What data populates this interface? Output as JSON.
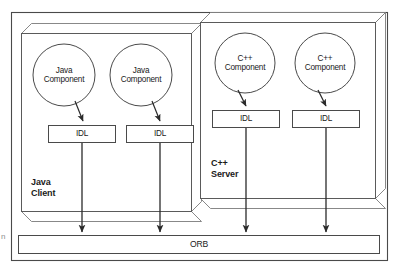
{
  "figure": {
    "margin_glyph": "n"
  },
  "zones": [
    {
      "id": "java-client",
      "label_line1": "Java",
      "label_line2": "Client",
      "x": 21,
      "y": 33,
      "w": 170,
      "h": 178,
      "depth": 10
    },
    {
      "id": "cpp-server",
      "label_line1": "C++",
      "label_line2": "Server",
      "x": 200,
      "y": 22,
      "w": 175,
      "h": 176,
      "depth": 10
    }
  ],
  "components": [
    {
      "id": "java-component-1",
      "line1": "Java",
      "line2": "Component",
      "cx": 64,
      "cy": 75,
      "r": 31
    },
    {
      "id": "java-component-2",
      "line1": "Java",
      "line2": "Component",
      "cx": 141,
      "cy": 75,
      "r": 31
    },
    {
      "id": "cpp-component-1",
      "line1": "C++",
      "line2": "Component",
      "cx": 245,
      "cy": 63,
      "r": 30
    },
    {
      "id": "cpp-component-2",
      "line1": "C++",
      "line2": "Component",
      "cx": 325,
      "cy": 63,
      "r": 30
    }
  ],
  "idl_boxes": [
    {
      "id": "idl-java-1",
      "label": "IDL",
      "x": 48,
      "y": 125,
      "w": 68,
      "h": 18
    },
    {
      "id": "idl-java-2",
      "label": "IDL",
      "x": 126,
      "y": 125,
      "w": 68,
      "h": 18
    },
    {
      "id": "idl-cpp-1",
      "label": "IDL",
      "x": 212,
      "y": 110,
      "w": 68,
      "h": 18
    },
    {
      "id": "idl-cpp-2",
      "label": "IDL",
      "x": 292,
      "y": 110,
      "w": 68,
      "h": 18
    }
  ],
  "bus": {
    "id": "orb-bus",
    "label": "ORB",
    "x": 18,
    "y": 235,
    "w": 362,
    "h": 19
  },
  "frame": {
    "x": 11,
    "y": 12,
    "w": 377,
    "h": 249
  },
  "connectors": {
    "component_to_idl": [
      {
        "from": "java-component-1",
        "to": "idl-java-1"
      },
      {
        "from": "java-component-2",
        "to": "idl-java-2"
      },
      {
        "from": "cpp-component-1",
        "to": "idl-cpp-1"
      },
      {
        "from": "cpp-component-2",
        "to": "idl-cpp-2"
      }
    ],
    "idl_to_bus": [
      {
        "from": "idl-java-1",
        "x": 82
      },
      {
        "from": "idl-java-2",
        "x": 160
      },
      {
        "from": "idl-cpp-1",
        "x": 246
      },
      {
        "from": "idl-cpp-2",
        "x": 326
      }
    ]
  },
  "colors": {
    "stroke": "#3a3a3a",
    "stroke_light": "#6e6e6e",
    "text": "#1a1a1a",
    "background": "#ffffff"
  }
}
